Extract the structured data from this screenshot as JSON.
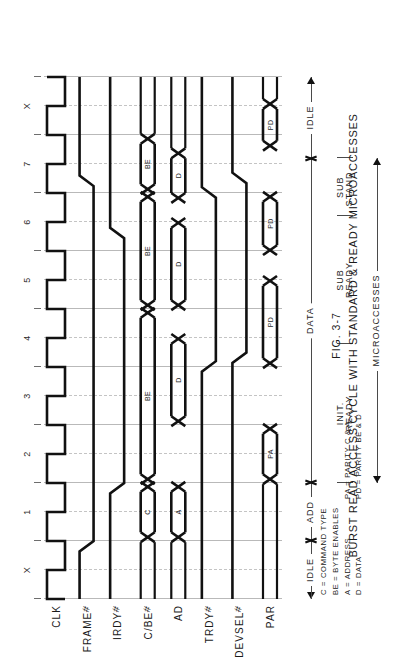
{
  "figure": {
    "number": "FIG. 3-7",
    "title": "BURST READ ACCESS CYCLE WITH STANDARD & READY MICROACCESSES"
  },
  "axis": {
    "cycle_labels": [
      "X",
      "1",
      "2",
      "3",
      "4",
      "5",
      "6",
      "7",
      "X"
    ]
  },
  "signals": [
    {
      "name": "CLK",
      "label": "CLK",
      "hash": false
    },
    {
      "name": "FRAME",
      "label": "FRAME",
      "hash": true
    },
    {
      "name": "IRDY",
      "label": "IRDY",
      "hash": true
    },
    {
      "name": "CBE",
      "label": "C/BE",
      "hash": true
    },
    {
      "name": "AD",
      "label": "AD",
      "hash": false
    },
    {
      "name": "TRDY",
      "label": "TRDY",
      "hash": true
    },
    {
      "name": "DEVSEL",
      "label": "DEVSEL",
      "hash": true
    },
    {
      "name": "PAR",
      "label": "PAR",
      "hash": false
    }
  ],
  "bus_values": {
    "cbe": [
      "C",
      "BE",
      "BE",
      "BE"
    ],
    "ad": [
      "A",
      "D",
      "D",
      "D"
    ],
    "par": [
      "PA",
      "PD",
      "PD",
      "PD"
    ]
  },
  "phases": {
    "top": [
      {
        "label": "IDLE",
        "start": 0.0,
        "end": 1.0
      },
      {
        "label": "ADD",
        "start": 1.0,
        "end": 2.0
      },
      {
        "label": "DATA",
        "start": 2.0,
        "end": 7.6
      },
      {
        "label": "IDLE",
        "start": 7.6,
        "end": 9.0
      }
    ],
    "middle": [
      {
        "label": "INIT.\nREADY",
        "start": 2.0,
        "end": 4.4
      },
      {
        "label": "SUB\nREADY",
        "start": 4.4,
        "end": 6.6
      },
      {
        "label": "SUB\nSTAND.",
        "start": 6.6,
        "end": 7.6
      }
    ],
    "bottom": {
      "label": "MICROACCESSES",
      "start": 2.0,
      "end": 7.6
    }
  },
  "legend": [
    {
      "left": "C = COMMAND TYPE",
      "right": ""
    },
    {
      "left": "BE = BYTE ENABLES",
      "right": ""
    },
    {
      "left": "A = ADDRESS",
      "right": "PA = PARITY  C & A"
    },
    {
      "left": "D = DATA",
      "right": "PD = PARITY  BE & D"
    }
  ]
}
